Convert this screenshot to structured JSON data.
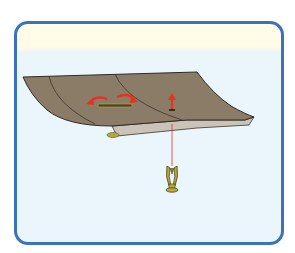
{
  "caption": {
    "text": ""
  },
  "figure": {
    "frame_color": "#3a73b8",
    "background_top": "#fffbe6",
    "background_main": "#eaf5fc",
    "panel_color": "#8b7c68",
    "panel_edge_color": "#c9c3b8",
    "arrow_color": "#e8321e",
    "fastener_color": "#b8a83a",
    "elements": [
      {
        "name": "headliner-panel",
        "description": "curved interior trim panel"
      },
      {
        "name": "rotate-arrows",
        "description": "two curved red arrows indicating twist"
      },
      {
        "name": "lift-arrow",
        "description": "small red upward arrow"
      },
      {
        "name": "push-pin-clip",
        "description": "yellow split-prong fastener below panel"
      },
      {
        "name": "guide-line",
        "description": "red line linking clip to panel hole"
      }
    ]
  }
}
